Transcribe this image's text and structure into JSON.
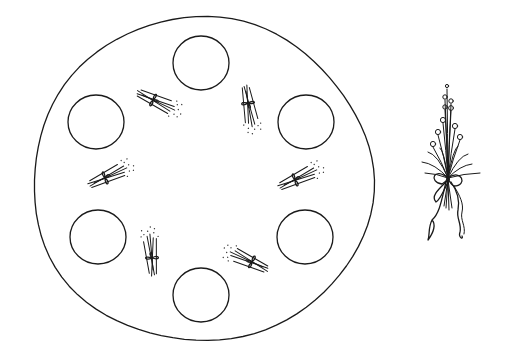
{
  "figure": {
    "stroke_color": "#1a1a1a",
    "background": "#ffffff"
  },
  "tray": {
    "cx": 202,
    "cy": 180,
    "rx": 170,
    "ry": 162,
    "place_circles": [
      {
        "name": "top",
        "cx": 201,
        "cy": 63,
        "r": 28
      },
      {
        "name": "upper-left",
        "cx": 96,
        "cy": 122,
        "r": 28
      },
      {
        "name": "upper-right",
        "cx": 306,
        "cy": 122,
        "r": 28
      },
      {
        "name": "lower-left",
        "cx": 98,
        "cy": 237,
        "r": 28
      },
      {
        "name": "lower-right",
        "cx": 305,
        "cy": 237,
        "r": 28
      },
      {
        "name": "bottom",
        "cx": 201,
        "cy": 295,
        "r": 28
      }
    ],
    "sprigs": [
      {
        "name": "upper-left",
        "x": 153,
        "y": 100,
        "angle": 25
      },
      {
        "name": "upper-right",
        "x": 248,
        "y": 103,
        "angle": 80
      },
      {
        "name": "left",
        "x": 105,
        "y": 178,
        "angle": -25
      },
      {
        "name": "right",
        "x": 295,
        "y": 180,
        "angle": -25
      },
      {
        "name": "lower-left",
        "x": 152,
        "y": 258,
        "angle": -95
      },
      {
        "name": "lower-right",
        "x": 252,
        "y": 262,
        "angle": 205
      }
    ]
  },
  "bouquet": {
    "x": 448,
    "y": 178
  }
}
